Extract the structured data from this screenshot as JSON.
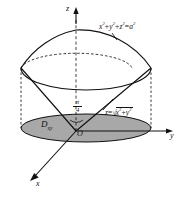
{
  "figure": {
    "type": "3d-geometry-diagram",
    "background": "#ffffff",
    "stroke_color": "#111111",
    "shade_color": "#a9a9a9"
  },
  "axes": {
    "x_label": "x",
    "y_label": "y",
    "z_label": "z",
    "origin_label": "O"
  },
  "labels": {
    "sphere_equation": {
      "base_x": "x",
      "base_y": "y",
      "base_z": "z",
      "exp": "2",
      "equals": "=",
      "rhs_base": "a",
      "rhs_exp": "2",
      "plain": "x^2+y^2+z^2=a^2"
    },
    "cone_equation": {
      "lhs": "z",
      "equals": "=",
      "radicand_x": "x",
      "radicand_y": "y",
      "exp": "2",
      "plain": "z=sqrt(x^2+y^2)"
    },
    "angle": {
      "numerator": "π",
      "denominator": "4",
      "plain": "pi/4"
    },
    "domain": {
      "base": "D",
      "subscript": "xy",
      "plain": "D_xy"
    }
  },
  "geometry": {
    "sphere_radius_px": 86,
    "cap_apex_y_px": 30,
    "intersection_ellipse": {
      "cx": 76,
      "cy": 68,
      "rx": 56,
      "ry": 17,
      "front_solid": true,
      "back_dashed": true
    },
    "base_ellipse": {
      "cx": 86,
      "cy": 128,
      "rx": 65,
      "ry": 14,
      "filled": true
    },
    "cone_apex": {
      "x": 76,
      "y": 131
    }
  }
}
